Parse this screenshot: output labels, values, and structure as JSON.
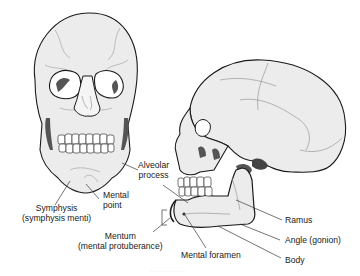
{
  "figure": {
    "views": [
      {
        "id": "anterior",
        "name": "Skull, anterior view"
      },
      {
        "id": "lateral",
        "name": "Skull, left lateral view"
      }
    ],
    "labels": {
      "symphysis": {
        "line1": "Symphysis",
        "line2": "(symphysis menti)"
      },
      "mental_point": {
        "line1": "Mental",
        "line2": "point"
      },
      "alveolar_process": {
        "line1": "Alveolar",
        "line2": "process"
      },
      "mentum": {
        "line1": "Mentum",
        "line2": "(mental protuberance)"
      },
      "mental_foramen": {
        "text": "Mental foramen"
      },
      "ramus": {
        "text": "Ramus"
      },
      "angle": {
        "text": "Angle (gonion)"
      },
      "body": {
        "text": "Body"
      }
    },
    "caption": "· · · · · · · · · · · ·",
    "colors": {
      "line": "#1a1a1a",
      "bone": "#ececec",
      "shade": "#555555",
      "leader": "#3a3a3a"
    }
  }
}
